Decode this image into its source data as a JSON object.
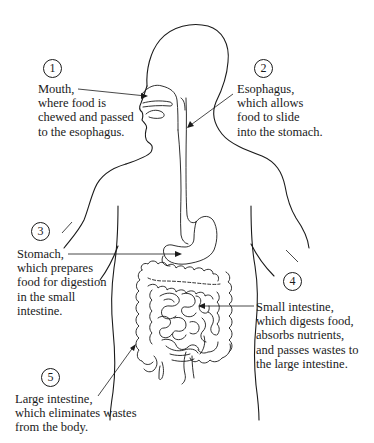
{
  "figure": {
    "stroke_color": "#1a1a1a",
    "background": "#ffffff"
  },
  "callouts": [
    {
      "number": "1",
      "organ": "Mouth",
      "lines": [
        "Mouth,",
        "where food is",
        "chewed and passed",
        "to the esophagus."
      ]
    },
    {
      "number": "2",
      "organ": "Esophagus",
      "lines": [
        "Esophagus,",
        "which allows",
        "food to slide",
        "into the stomach."
      ]
    },
    {
      "number": "3",
      "organ": "Stomach",
      "lines": [
        "Stomach,",
        "which prepares",
        "food for digestion",
        "in the small",
        "intestine."
      ]
    },
    {
      "number": "4",
      "organ": "Small intestine",
      "lines": [
        "Small intestine,",
        "which digests food,",
        "absorbs nutrients,",
        "and passes wastes to",
        "the large intestine."
      ]
    },
    {
      "number": "5",
      "organ": "Large intestine",
      "lines": [
        "Large intestine,",
        "which eliminates wastes",
        "from the body."
      ]
    }
  ]
}
